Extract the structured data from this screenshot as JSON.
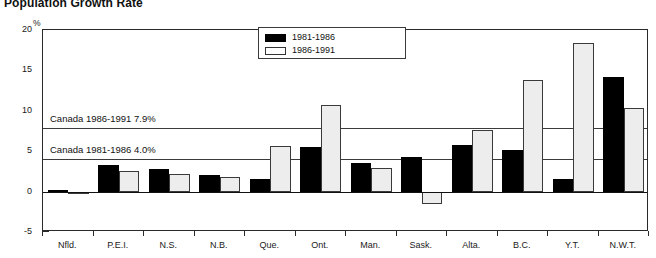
{
  "chart_data": {
    "type": "bar",
    "title": "Population Growth Rate",
    "xlabel": "",
    "ylabel": "%",
    "ylim": [
      -5,
      20
    ],
    "yticks": [
      20,
      15,
      10,
      5,
      0,
      -5
    ],
    "ytick_labels": [
      "20",
      "15",
      "10",
      "5",
      "0",
      "-5"
    ],
    "grid": false,
    "legend_position": "top-center",
    "categories": [
      "Nfld.",
      "P.E.I.",
      "N.S.",
      "N.B.",
      "Que.",
      "Ont.",
      "Man.",
      "Sask.",
      "Alta.",
      "B.C.",
      "Y.T.",
      "N.W.T."
    ],
    "series": [
      {
        "name": "1981-1986",
        "color": "#000000",
        "values": [
          0.2,
          3.3,
          2.8,
          2.0,
          1.5,
          5.5,
          3.6,
          4.3,
          5.8,
          5.1,
          1.5,
          14.2
        ]
      },
      {
        "name": "1986-1991",
        "color": "#ffffff",
        "values": [
          0.0,
          2.6,
          2.2,
          1.8,
          5.6,
          10.7,
          2.9,
          -1.5,
          7.6,
          13.8,
          18.4,
          10.3
        ]
      }
    ],
    "annotations": [
      {
        "label": "Canada 1986-1991 7.9%",
        "value": 7.9
      },
      {
        "label": "Canada 1981-1986 4.0%",
        "value": 4.0
      }
    ]
  },
  "legend": {
    "entries": [
      {
        "label": "1981-1986"
      },
      {
        "label": "1986-1991"
      }
    ]
  }
}
